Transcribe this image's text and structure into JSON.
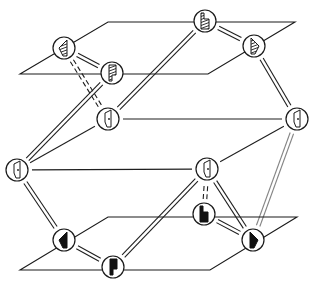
{
  "diagram": {
    "title": "",
    "colors": {
      "ink": "#1a1a1a",
      "background": "#ffffff"
    },
    "planes": [
      {
        "id": "top-plane",
        "points": [
          [
            20,
            74
          ],
          [
            108,
            22
          ],
          [
            295,
            22
          ],
          [
            208,
            74
          ]
        ]
      },
      {
        "id": "bottom-plane",
        "points": [
          [
            20,
            270
          ],
          [
            108,
            217
          ],
          [
            297,
            217
          ],
          [
            210,
            270
          ]
        ]
      }
    ],
    "nodes": [
      {
        "id": "A",
        "layer": "top",
        "x": 64,
        "y": 48,
        "glyph": "hatched-left-wedge"
      },
      {
        "id": "B",
        "layer": "top",
        "x": 112,
        "y": 73,
        "glyph": "hatched-flag"
      },
      {
        "id": "C",
        "layer": "top",
        "x": 205,
        "y": 21,
        "glyph": "hatched-step"
      },
      {
        "id": "D",
        "layer": "top",
        "x": 254,
        "y": 46,
        "glyph": "hatched-right-wedge"
      },
      {
        "id": "E",
        "layer": "middle",
        "x": 108,
        "y": 119,
        "glyph": "outline-door-dot"
      },
      {
        "id": "F",
        "layer": "middle",
        "x": 297,
        "y": 119,
        "glyph": "outline-door-dot"
      },
      {
        "id": "G",
        "layer": "middle",
        "x": 17,
        "y": 170,
        "glyph": "outline-door-dot"
      },
      {
        "id": "H",
        "layer": "middle",
        "x": 207,
        "y": 169,
        "glyph": "outline-door-dot"
      },
      {
        "id": "I",
        "layer": "bottom",
        "x": 64,
        "y": 240,
        "glyph": "solid-left-triangle"
      },
      {
        "id": "J",
        "layer": "bottom",
        "x": 113,
        "y": 267,
        "glyph": "solid-flag"
      },
      {
        "id": "K",
        "layer": "bottom",
        "x": 204,
        "y": 214,
        "glyph": "solid-step"
      },
      {
        "id": "L",
        "layer": "bottom",
        "x": 253,
        "y": 240,
        "glyph": "solid-right-triangle"
      }
    ],
    "edges": [
      {
        "from": "A",
        "to": "B",
        "style": "double"
      },
      {
        "from": "C",
        "to": "D",
        "style": "double"
      },
      {
        "from": "A",
        "to": "E",
        "style": "double-dashed"
      },
      {
        "from": "B",
        "to": "G",
        "style": "double"
      },
      {
        "from": "C",
        "to": "E",
        "style": "double"
      },
      {
        "from": "D",
        "to": "F",
        "style": "double"
      },
      {
        "from": "E",
        "to": "F",
        "style": "single"
      },
      {
        "from": "G",
        "to": "H",
        "style": "single"
      },
      {
        "from": "G",
        "to": "E",
        "style": "single"
      },
      {
        "from": "H",
        "to": "F",
        "style": "single"
      },
      {
        "from": "G",
        "to": "I",
        "style": "double"
      },
      {
        "from": "I",
        "to": "J",
        "style": "double"
      },
      {
        "from": "H",
        "to": "J",
        "style": "double"
      },
      {
        "from": "H",
        "to": "L",
        "style": "double"
      },
      {
        "from": "F",
        "to": "L",
        "style": "double-faint"
      },
      {
        "from": "K",
        "to": "L",
        "style": "double"
      },
      {
        "from": "K",
        "to": "H",
        "style": "double-dashed"
      }
    ]
  }
}
